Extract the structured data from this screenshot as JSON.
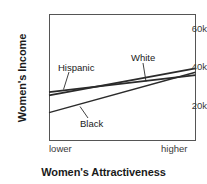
{
  "chart_data": {
    "type": "line",
    "title": "",
    "xlabel": "Women's Attractiveness",
    "ylabel": "Women's Income",
    "x": [
      0,
      1
    ],
    "xticklabels": [
      "lower",
      "higher"
    ],
    "yticklabels": [
      "20k",
      "40k",
      "60k"
    ],
    "yticks": [
      20000,
      40000,
      60000
    ],
    "ylim": [
      7000,
      67000
    ],
    "xlim": [
      0,
      1
    ],
    "grid": false,
    "legend_position": "inline-annotations",
    "series": [
      {
        "name": "Hispanic",
        "values": [
          26700,
          35500
        ],
        "color": "#2b2b2b"
      },
      {
        "name": "White",
        "values": [
          25000,
          39000
        ],
        "color": "#2b2b2b"
      },
      {
        "name": "Black",
        "values": [
          16000,
          37000
        ],
        "color": "#2b2b2b"
      }
    ],
    "annotations": [
      {
        "label": "Hispanic",
        "series": "Hispanic"
      },
      {
        "label": "White",
        "series": "White"
      },
      {
        "label": "Black",
        "series": "Black"
      }
    ]
  },
  "axis": {
    "ylabel": "Women's Income",
    "xlabel": "Women's Attractiveness",
    "ytick_60k": "60k",
    "ytick_40k": "40k",
    "ytick_20k": "20k",
    "xtick_low": "lower",
    "xtick_high": "higher"
  },
  "labels": {
    "hispanic": "Hispanic",
    "white": "White",
    "black": "Black"
  },
  "colors": {
    "line": "#2b2b2b",
    "frame": "#555555",
    "text": "#1a1a1a",
    "tick_text": "#3a3a3a",
    "background": "#ffffff"
  }
}
